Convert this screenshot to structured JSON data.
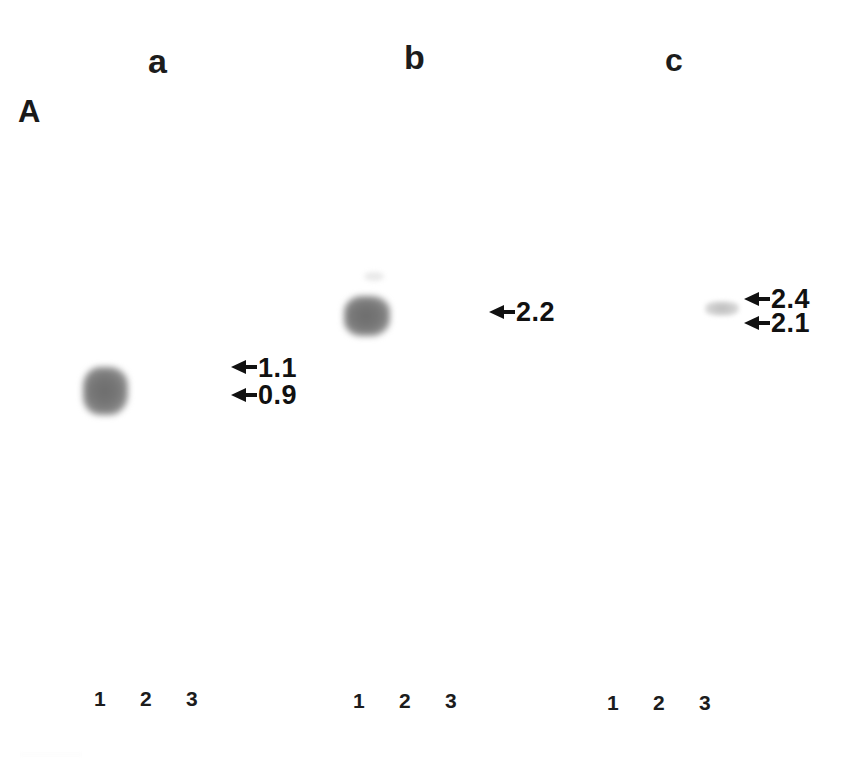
{
  "figure": {
    "panel_label": "A",
    "background_color": "#ffffff",
    "band_color": "#777777",
    "text_color": "#111111"
  },
  "groups": [
    {
      "label": "a",
      "lane_numbers": [
        "1",
        "2",
        "3"
      ],
      "markers": [
        {
          "value": "1.1"
        },
        {
          "value": "0.9"
        }
      ]
    },
    {
      "label": "b",
      "lane_numbers": [
        "1",
        "2",
        "3"
      ],
      "markers": [
        {
          "value": "2.2"
        }
      ]
    },
    {
      "label": "c",
      "lane_numbers": [
        "1",
        "2",
        "3"
      ],
      "markers": [
        {
          "value": "2.4"
        },
        {
          "value": "2.1"
        }
      ]
    }
  ]
}
